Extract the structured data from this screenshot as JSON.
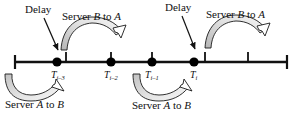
{
  "figure": {
    "type": "timeline-diagram",
    "background_color": "#ffffff",
    "line_color": "#000000",
    "arrow_fill_color": "#d9d9d9",
    "arrow_stroke_color": "#1a1a1a",
    "dot_color": "#000000"
  },
  "axis": {
    "name": "timeline-axis",
    "y": 62,
    "x_start": 14,
    "x_end": 288,
    "end_cap_height": 14,
    "tick_positions": [
      66,
      111,
      152,
      205,
      248
    ],
    "tick_height": 11
  },
  "events": [
    {
      "id": "t-i-3",
      "x": 57,
      "label": "T",
      "subscript": "i–3"
    },
    {
      "id": "t-i-2",
      "x": 111,
      "label": "T",
      "subscript": "i–2"
    },
    {
      "id": "t-i-1",
      "x": 152,
      "label": "T",
      "subscript": "i–1"
    },
    {
      "id": "t-i",
      "x": 194,
      "label": "T",
      "subscript": "i"
    }
  ],
  "annotations": {
    "delay_left": {
      "text": "Delay",
      "x": 27,
      "y": 5,
      "arrow_from": [
        48,
        18
      ],
      "arrow_to": [
        60,
        52
      ]
    },
    "delay_right": {
      "text": "Delay",
      "x": 167,
      "y": 3,
      "arrow_from": [
        180,
        16
      ],
      "arrow_to": [
        196,
        50
      ]
    },
    "server_b_to_a_left": {
      "text_prefix": "Server ",
      "text_italic_1": "B",
      "text_middle": " to ",
      "text_italic_2": "A",
      "full_text": "Server B to A",
      "x": 63,
      "y": 12
    },
    "server_b_to_a_right": {
      "text_prefix": "Server ",
      "text_italic_1": "B",
      "text_middle": " to ",
      "text_italic_2": "A",
      "full_text": "Server B to A",
      "x": 207,
      "y": 10
    },
    "server_a_to_b_left": {
      "text_prefix": "Server ",
      "text_italic_1": "A",
      "text_middle": " to ",
      "text_italic_2": "B",
      "full_text": "Server A to B",
      "x": 6,
      "y": 100
    },
    "server_a_to_b_right": {
      "text_prefix": "Server ",
      "text_italic_1": "A",
      "text_middle": " to ",
      "text_italic_2": "B",
      "full_text": "Server A to B",
      "x": 133,
      "y": 101
    }
  }
}
